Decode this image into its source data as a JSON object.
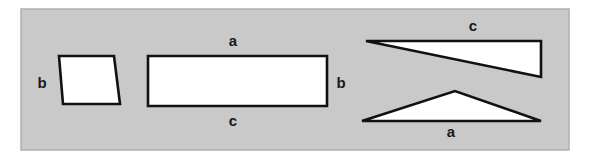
{
  "figure": {
    "canvas": {
      "width": 590,
      "height": 160
    },
    "colors": {
      "page_background": "#ffffff",
      "panel_background": "#c9c9c9",
      "panel_border": "#b0b0b0",
      "shape_fill": "#ffffff",
      "shape_stroke": "#111111",
      "label_color": "#1a1a1a"
    },
    "panel": {
      "x": 21,
      "y": 9,
      "width": 548,
      "height": 141
    },
    "shapes": [
      {
        "id": "parallelogram",
        "name": "parallelogram",
        "points": "59,56 114,56 120,104 63,104",
        "fill": "#ffffff",
        "stroke": "#111111",
        "stroke_width": 2.6
      },
      {
        "id": "rectangle",
        "name": "rectangle",
        "points": "148,56 327,56 327,106 148,106",
        "fill": "#ffffff",
        "stroke": "#111111",
        "stroke_width": 2.6
      },
      {
        "id": "obtuse-triangle-top",
        "name": "thin-obtuse-triangle",
        "points": "366,41 541,41 541,77",
        "fill": "#ffffff",
        "stroke": "#111111",
        "stroke_width": 2.6
      },
      {
        "id": "obtuse-triangle-bottom",
        "name": "wide-obtuse-triangle",
        "points": "362,121 455,91 541,121",
        "fill": "#ffffff",
        "stroke": "#111111",
        "stroke_width": 2.6
      }
    ],
    "labels": [
      {
        "id": "label-b-parallelogram",
        "text": "b",
        "x": 42,
        "y": 84
      },
      {
        "id": "label-a-rectangle-top",
        "text": "a",
        "x": 233,
        "y": 42
      },
      {
        "id": "label-c-rectangle-bottom",
        "text": "c",
        "x": 233,
        "y": 122
      },
      {
        "id": "label-b-rectangle-right",
        "text": "b",
        "x": 341,
        "y": 84
      },
      {
        "id": "label-c-triangle-top",
        "text": "c",
        "x": 473,
        "y": 27
      },
      {
        "id": "label-a-triangle-bottom",
        "text": "a",
        "x": 451,
        "y": 133
      }
    ]
  }
}
